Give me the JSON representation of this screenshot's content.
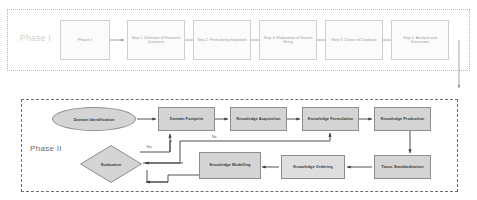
{
  "figure": {
    "background_color": "#ffffff",
    "phase_one": {
      "label": "Phase I",
      "border_style": "dotted",
      "border_color": "#b9b9b9",
      "nodes": [
        {
          "id": "p1-node-0",
          "label": "Phase I",
          "shape": "rect"
        },
        {
          "id": "p1-node-1",
          "label": "Step 1: Definition of Research Questions",
          "shape": "rect"
        },
        {
          "id": "p1-node-2",
          "label": "Step 2: Formulating Keywords",
          "shape": "rect"
        },
        {
          "id": "p1-node-3",
          "label": "Step 3: Elaboration of Search String",
          "shape": "rect"
        },
        {
          "id": "p1-node-4",
          "label": "Step 4: Choice of Database",
          "shape": "rect"
        },
        {
          "id": "p1-node-5",
          "label": "Step 5: Analysis and Discussion",
          "shape": "rect"
        }
      ]
    },
    "phase_two": {
      "label": "Phase II",
      "border_style": "dashed",
      "border_color": "#6d6d6d",
      "fill_color": "#d4d4d4",
      "stroke_color": "#8d8d8d",
      "nodes": [
        {
          "id": "p2-ellipse",
          "label": "Domain Identification",
          "shape": "ellipse"
        },
        {
          "id": "p2-node-1",
          "label": "Domain Footprint",
          "shape": "rect"
        },
        {
          "id": "p2-node-2",
          "label": "Knowledge Acquisition",
          "shape": "rect"
        },
        {
          "id": "p2-node-3",
          "label": "Knowledge Formulation",
          "shape": "rect"
        },
        {
          "id": "p2-node-4",
          "label": "Knowledge Production",
          "shape": "rect"
        },
        {
          "id": "p2-node-5",
          "label": "Taxos Standardization",
          "shape": "rect"
        },
        {
          "id": "p2-node-6",
          "label": "Knowledge Ordering",
          "shape": "rect"
        },
        {
          "id": "p2-node-7",
          "label": "Knowledge Modelling",
          "shape": "rect"
        },
        {
          "id": "p2-diamond",
          "label": "Evaluation",
          "shape": "diamond"
        }
      ],
      "edge_labels": {
        "yes": "Yes",
        "no": "No"
      }
    }
  }
}
